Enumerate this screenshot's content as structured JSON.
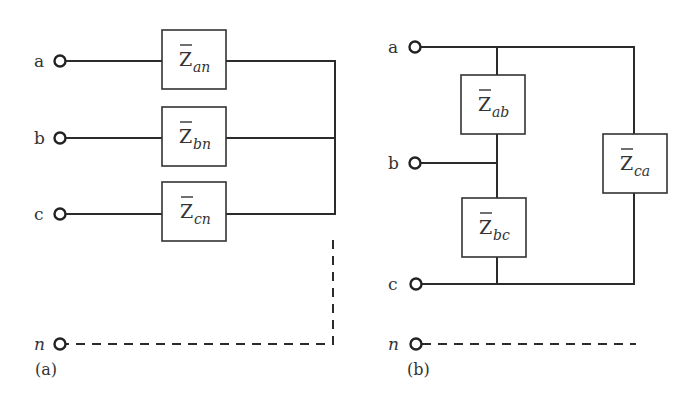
{
  "figure": {
    "panel_a": {
      "caption": "(a)",
      "terminals": [
        {
          "label": "a"
        },
        {
          "label": "b"
        },
        {
          "label": "c"
        },
        {
          "label": "n"
        }
      ],
      "impedances": [
        {
          "symbol": "Z",
          "subscript": "an"
        },
        {
          "symbol": "Z",
          "subscript": "bn"
        },
        {
          "symbol": "Z",
          "subscript": "cn"
        }
      ],
      "connection": "wye"
    },
    "panel_b": {
      "caption": "(b)",
      "terminals": [
        {
          "label": "a"
        },
        {
          "label": "b"
        },
        {
          "label": "c"
        },
        {
          "label": "n"
        }
      ],
      "impedances": [
        {
          "symbol": "Z",
          "subscript": "ab"
        },
        {
          "symbol": "Z",
          "subscript": "bc"
        },
        {
          "symbol": "Z",
          "subscript": "ca"
        }
      ],
      "connection": "delta"
    }
  }
}
